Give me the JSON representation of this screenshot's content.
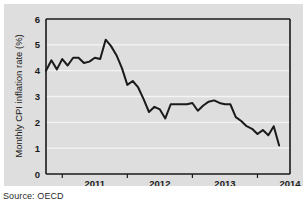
{
  "figure": {
    "panel_background": "#dedede",
    "page_background": "#ffffff",
    "source_label": "Source: OECD"
  },
  "chart_data": {
    "type": "line",
    "title": "",
    "subtitle": "",
    "xlabel": "",
    "ylabel": "Monthly CPI inflation rate (%)",
    "ylim": [
      0,
      6
    ],
    "ytick_labels": [
      "0",
      "1",
      "2",
      "3",
      "4",
      "5",
      "6"
    ],
    "ytick_values": [
      0,
      1,
      2,
      3,
      4,
      5,
      6
    ],
    "xtick_labels": [
      "2011",
      "2012",
      "2013",
      "2014"
    ],
    "xtick_values": [
      2011,
      2012,
      2013,
      2014
    ],
    "xlim": [
      2010.75,
      2014.5
    ],
    "grid": "horizontal-white",
    "legend": "none",
    "line_color": "#1a1a1a",
    "line_width": 2,
    "series": [
      {
        "name": "Monthly CPI inflation rate",
        "x": [
          2010.75,
          2010.833,
          2010.917,
          2011.0,
          2011.083,
          2011.167,
          2011.25,
          2011.333,
          2011.417,
          2011.5,
          2011.583,
          2011.667,
          2011.75,
          2011.833,
          2011.917,
          2012.0,
          2012.083,
          2012.167,
          2012.25,
          2012.333,
          2012.417,
          2012.5,
          2012.583,
          2012.667,
          2012.75,
          2012.833,
          2012.917,
          2013.0,
          2013.083,
          2013.167,
          2013.25,
          2013.333,
          2013.417,
          2013.5,
          2013.583,
          2013.667,
          2013.75,
          2013.833,
          2013.917,
          2014.0,
          2014.083,
          2014.167,
          2014.25,
          2014.333
        ],
        "values": [
          4.0,
          4.4,
          4.05,
          4.45,
          4.2,
          4.5,
          4.5,
          4.3,
          4.35,
          4.5,
          4.45,
          5.2,
          4.95,
          4.6,
          4.1,
          3.45,
          3.6,
          3.35,
          2.9,
          2.4,
          2.6,
          2.5,
          2.15,
          2.7,
          2.7,
          2.7,
          2.7,
          2.75,
          2.45,
          2.65,
          2.8,
          2.85,
          2.75,
          2.7,
          2.7,
          2.2,
          2.05,
          1.85,
          1.75,
          1.55,
          1.7,
          1.5,
          1.85,
          1.1
        ]
      }
    ],
    "annotations": []
  }
}
